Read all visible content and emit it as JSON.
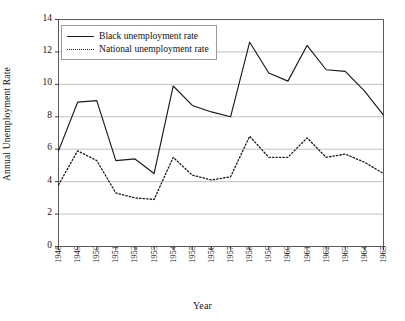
{
  "chart_data": {
    "type": "line",
    "title": "",
    "xlabel": "Year",
    "ylabel": "Annual Unemployment Rate",
    "categories": [
      1948,
      1949,
      1950,
      1951,
      1952,
      1953,
      1954,
      1955,
      1956,
      1957,
      1958,
      1959,
      1960,
      1961,
      1962,
      1963,
      1964,
      1965
    ],
    "x": [
      "1948",
      "1949",
      "1950",
      "1951",
      "1952",
      "1953",
      "1954",
      "1955",
      "1956",
      "1957",
      "1958",
      "1959",
      "1960",
      "1961",
      "1962",
      "1963",
      "1964",
      "1965"
    ],
    "xlim": [
      1948,
      1965
    ],
    "ylim": [
      0,
      14
    ],
    "yticks": [
      "0",
      "2",
      "4",
      "6",
      "8",
      "10",
      "12",
      "14"
    ],
    "ytick_values": [
      0,
      2,
      4,
      6,
      8,
      10,
      12,
      14
    ],
    "grid": "horizontal",
    "legend_position": "upper-left-inside",
    "series": [
      {
        "name": "Black unemployment rate",
        "style": "solid",
        "color": "#1a1a1a",
        "values": [
          5.9,
          8.9,
          9.0,
          5.3,
          5.4,
          4.5,
          9.9,
          8.7,
          8.3,
          8.0,
          12.6,
          10.7,
          10.2,
          12.4,
          10.9,
          10.8,
          9.6,
          8.1
        ]
      },
      {
        "name": "National unemployment rate",
        "style": "dotted",
        "color": "#1a1a1a",
        "values": [
          3.8,
          5.9,
          5.3,
          3.3,
          3.0,
          2.9,
          5.5,
          4.4,
          4.1,
          4.3,
          6.8,
          5.5,
          5.5,
          6.7,
          5.5,
          5.7,
          5.2,
          4.5
        ]
      }
    ]
  }
}
